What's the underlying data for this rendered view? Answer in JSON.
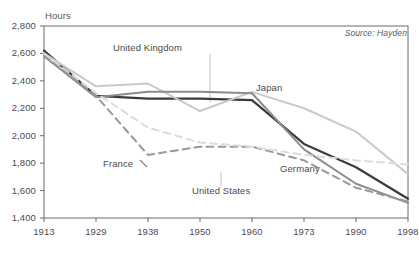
{
  "chart_data": {
    "type": "line",
    "title": "",
    "ylabel": "Hours",
    "xlabel": "",
    "ylim": [
      1400,
      2800
    ],
    "ytick_labels": [
      "2,800",
      "2,600",
      "2,400",
      "2,200",
      "2,000",
      "1,800",
      "1,600",
      "1,400"
    ],
    "ytick_values": [
      2800,
      2600,
      2400,
      2200,
      2000,
      1800,
      1600,
      1400
    ],
    "grid": false,
    "legend_position": "inline-annotations",
    "categories": [
      "1913",
      "1929",
      "1938",
      "1950",
      "1960",
      "1973",
      "1990",
      "1998"
    ],
    "x": [
      1913,
      1929,
      1938,
      1950,
      1960,
      1973,
      1990,
      1998
    ],
    "series": [
      {
        "name": "United Kingdom",
        "values": [
          2620,
          2290,
          2270,
          2270,
          2260,
          1940,
          1770,
          1540
        ],
        "color": "#3b3b3b",
        "style": "solid"
      },
      {
        "name": "Japan",
        "values": [
          2600,
          2360,
          2380,
          2180,
          2320,
          2200,
          2030,
          1720
        ],
        "color": "#c9c9c9",
        "style": "solid"
      },
      {
        "name": "Germany",
        "values": [
          2580,
          2280,
          2320,
          2320,
          2310,
          1900,
          1650,
          1510
        ],
        "color": "#8c8c8c",
        "style": "solid"
      },
      {
        "name": "France",
        "values": [
          2590,
          2290,
          1860,
          1920,
          1920,
          1820,
          1620,
          1520
        ],
        "color": "#999999",
        "style": "dashed"
      },
      {
        "name": "United States",
        "values": [
          2600,
          2310,
          2060,
          1950,
          1920,
          1860,
          1820,
          1790
        ],
        "color": "#dcdcdc",
        "style": "dashed"
      }
    ],
    "annotations": [
      {
        "text": "United Kingdom",
        "series": "United Kingdom"
      },
      {
        "text": "Japan",
        "series": "Japan"
      },
      {
        "text": "Germany",
        "series": "Germany"
      },
      {
        "text": "France",
        "series": "France"
      },
      {
        "text": "United States",
        "series": "United States"
      }
    ],
    "source": "Source: Hayden"
  },
  "labels": {
    "y_axis_title": "Hours",
    "source": "Source: Hayden",
    "united_kingdom": "United Kingdom",
    "japan": "Japan",
    "germany": "Germany",
    "france": "France",
    "united_states": "United States"
  }
}
